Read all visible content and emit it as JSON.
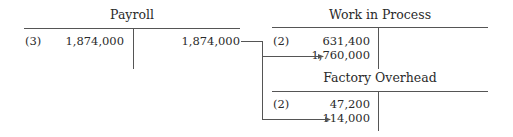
{
  "accounts": [
    {
      "name": "Payroll",
      "debits": [
        {
          "ref": "(3)",
          "amount": "1,874,000"
        }
      ],
      "credits": [
        {
          "ref": "",
          "amount": "1,874,000"
        }
      ]
    },
    {
      "name": "Work in Process",
      "debits": [
        {
          "ref": "(2)",
          "amount": "631,400"
        },
        {
          "ref": "",
          "amount": "1,760,000"
        }
      ],
      "credits": []
    },
    {
      "name": "Factory Overhead",
      "debits": [
        {
          "ref": "(2)",
          "amount": "47,200"
        },
        {
          "ref": "",
          "amount": "114,000"
        }
      ],
      "credits": []
    }
  ],
  "colors": {
    "line": "#555555",
    "text": "#2a2a2a"
  }
}
